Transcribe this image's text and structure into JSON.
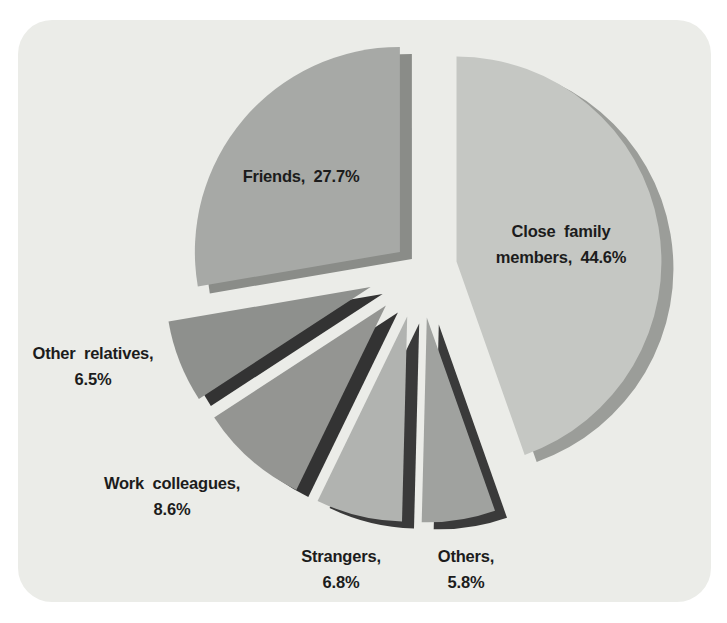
{
  "colors": {
    "page_background": "#ffffff",
    "card_background": "#ebece8",
    "label_text": "#1c1c1c"
  },
  "labels": {
    "friends": {
      "lines": [
        "Friends, 27.7%"
      ]
    },
    "close_family": {
      "lines": [
        "Close family",
        "members, 44.6%"
      ]
    },
    "other_relatives": {
      "lines": [
        "Other relatives,",
        "6.5%"
      ]
    },
    "work_colleagues": {
      "lines": [
        "Work colleagues,",
        "8.6%"
      ]
    },
    "strangers": {
      "lines": [
        "Strangers,",
        "6.8%"
      ]
    },
    "others": {
      "lines": [
        "Others,",
        "5.8%"
      ]
    }
  },
  "chart_data": {
    "type": "pie",
    "title": "",
    "style": "exploded pie with offset dark side-shadows, grayscale print",
    "start_angle_deg": 0,
    "direction": "clockwise",
    "legend": "none",
    "labels_on_chart": true,
    "slices": [
      {
        "id": "close-family-members",
        "name": "Close family members",
        "value": 44.6,
        "data_label": "Close family members, 44.6%",
        "color": "#c5c7c3",
        "shadow_color": "#9b9d99"
      },
      {
        "id": "others",
        "name": "Others",
        "value": 5.8,
        "data_label": "Others, 5.8%",
        "color": "#a0a29f",
        "shadow_color": "#3a3a3a"
      },
      {
        "id": "strangers",
        "name": "Strangers",
        "value": 6.8,
        "data_label": "Strangers, 6.8%",
        "color": "#b1b3b0",
        "shadow_color": "#3a3a3a"
      },
      {
        "id": "work-colleagues",
        "name": "Work colleagues",
        "value": 8.6,
        "data_label": "Work colleagues, 8.6%",
        "color": "#949592",
        "shadow_color": "#333333"
      },
      {
        "id": "other-relatives",
        "name": "Other relatives",
        "value": 6.5,
        "data_label": "Other relatives, 6.5%",
        "color": "#8e908d",
        "shadow_color": "#333333"
      },
      {
        "id": "friends",
        "name": "Friends",
        "value": 27.7,
        "data_label": "Friends, 27.7%",
        "color": "#a7a9a6",
        "shadow_color": "#8a8c88"
      }
    ]
  }
}
